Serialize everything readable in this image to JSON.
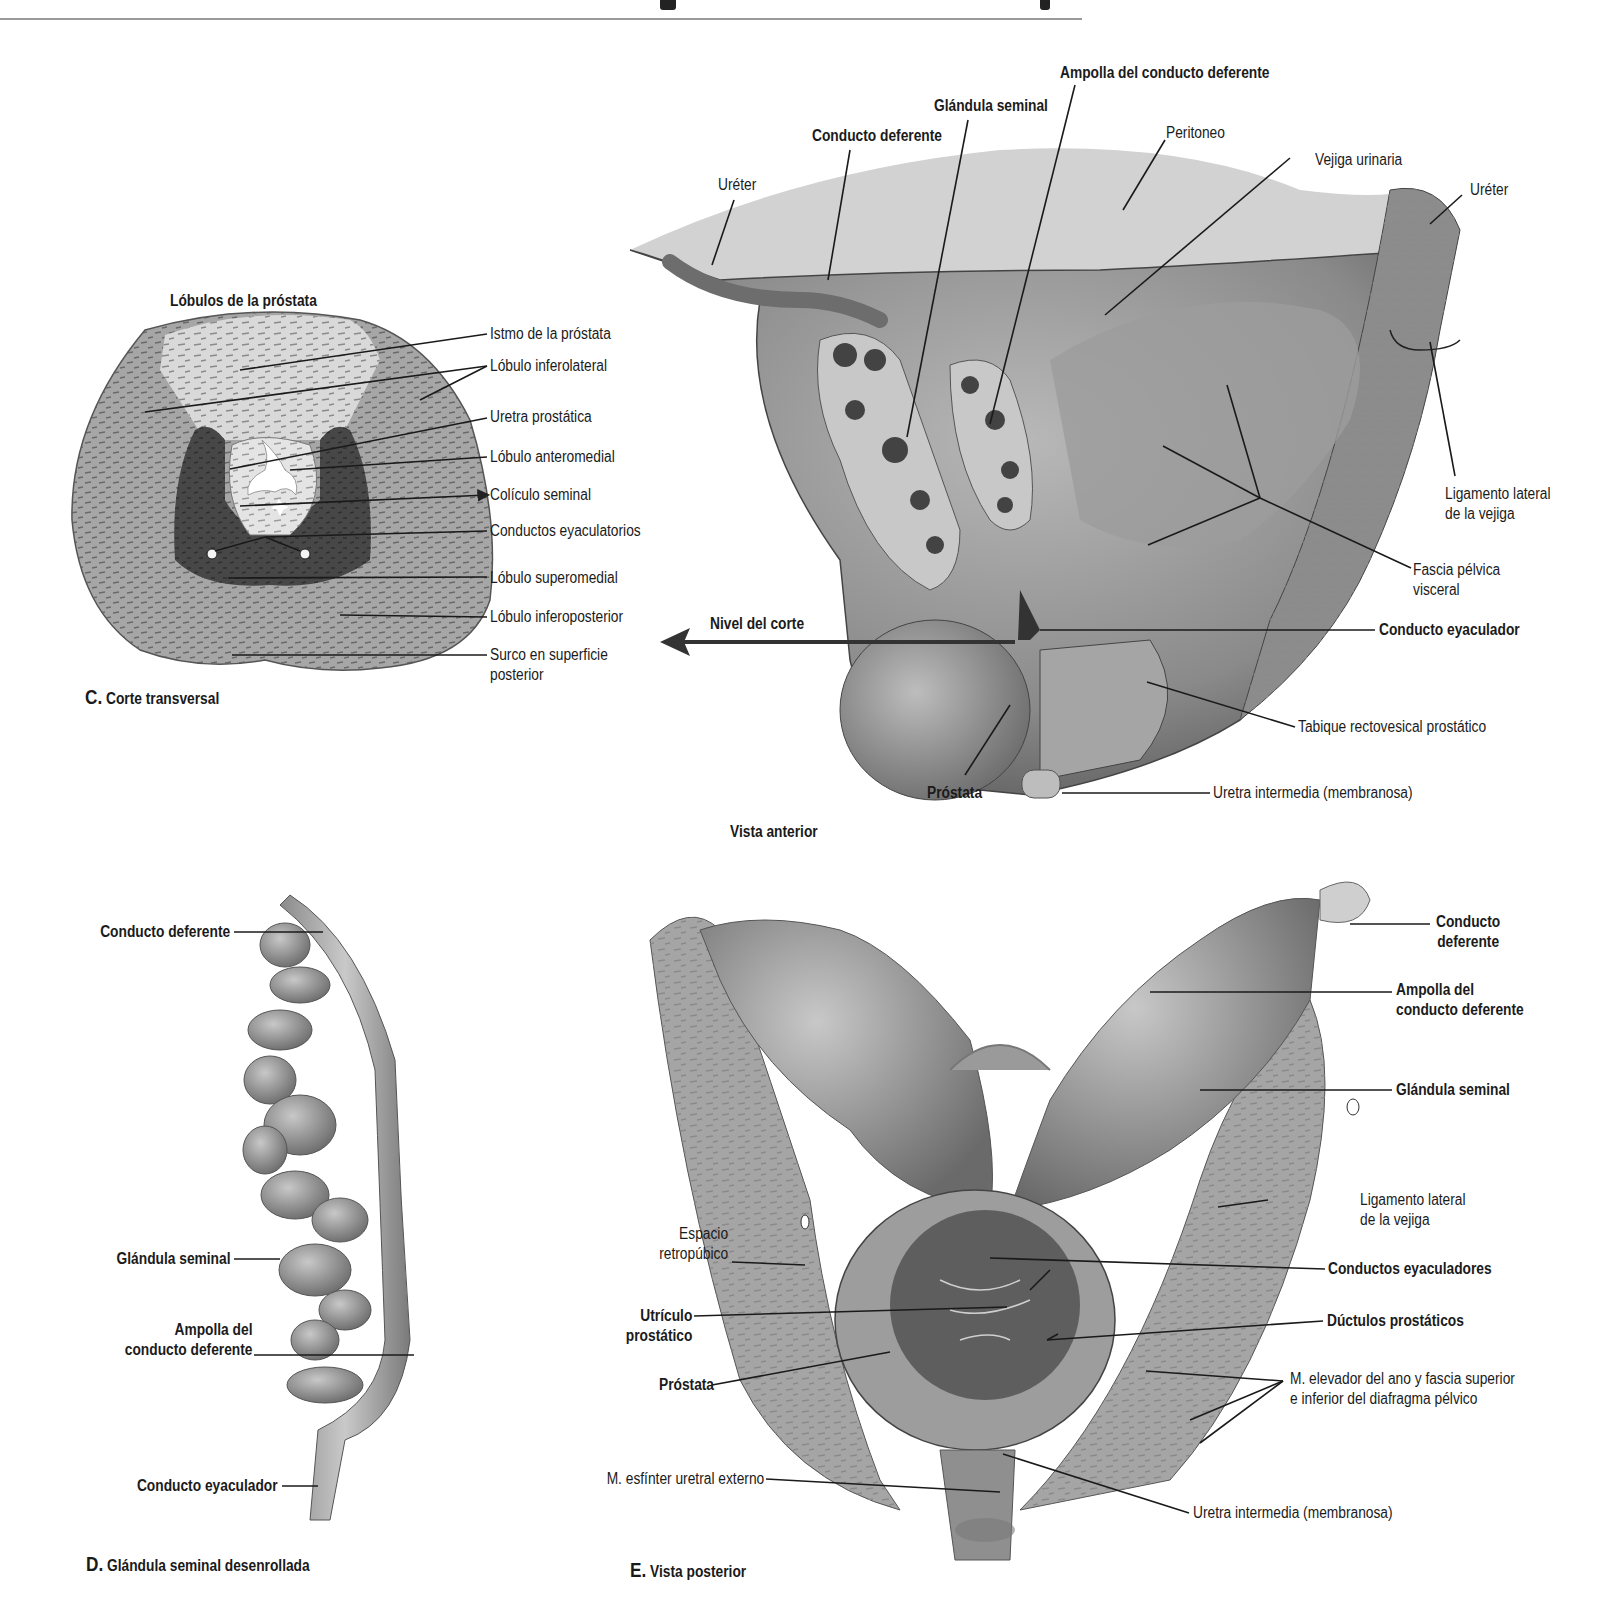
{
  "page": {
    "background": "#ffffff",
    "rule_color": "#9a9a9a"
  },
  "figure_c": {
    "title": "Lóbulos de la próstata",
    "caption_letter": "C.",
    "caption_text": "Corte transversal",
    "labels": [
      {
        "text": "Istmo de la próstata"
      },
      {
        "text": "Lóbulo inferolateral"
      },
      {
        "text": "Uretra prostática"
      },
      {
        "text": "Lóbulo anteromedial"
      },
      {
        "text": "Colículo seminal"
      },
      {
        "text": "Conductos eyaculatorios"
      },
      {
        "text": "Lóbulo superomedial"
      },
      {
        "text": "Lóbulo inferoposterior"
      },
      {
        "text": "Surco en superficie\nposterior"
      }
    ],
    "colors": {
      "outer": "#a8a8a8",
      "isthmus": "#d6d6d6",
      "medial": "#4a4a4a",
      "urethra_zone": "#e2e2e2"
    }
  },
  "figure_anterior": {
    "caption": "Vista anterior",
    "cut_level_label": "Nivel del corte",
    "labels_bold": [
      {
        "text": "Ampolla del conducto deferente"
      },
      {
        "text": "Glándula seminal"
      },
      {
        "text": "Conducto deferente"
      },
      {
        "text": "Conducto eyaculador"
      },
      {
        "text": "Próstata"
      }
    ],
    "labels_regular": [
      {
        "text": "Peritoneo"
      },
      {
        "text": "Vejiga urinaria"
      },
      {
        "text": "Uréter"
      },
      {
        "text": "Uréter"
      },
      {
        "text": "Ligamento lateral\nde la vejiga"
      },
      {
        "text": "Fascia pélvica\nvisceral"
      },
      {
        "text": "Tabique rectovesical prostático"
      },
      {
        "text": "Uretra intermedia (membranosa)"
      }
    ]
  },
  "figure_d": {
    "caption_letter": "D.",
    "caption_text": "Glándula seminal desenrollada",
    "labels": [
      {
        "text": "Conducto deferente"
      },
      {
        "text": "Glándula seminal"
      },
      {
        "text": "Ampolla del\nconducto deferente"
      },
      {
        "text": "Conducto eyaculador"
      }
    ]
  },
  "figure_e": {
    "caption_letter": "E.",
    "caption_text": "Vista posterior",
    "labels_bold": [
      {
        "text": "Conducto\ndeferente"
      },
      {
        "text": "Ampolla del\nconducto deferente"
      },
      {
        "text": "Glándula seminal"
      },
      {
        "text": "Conductos eyaculadores"
      },
      {
        "text": "Dúctulos prostáticos"
      },
      {
        "text": "Utrículo\nprostático"
      },
      {
        "text": "Próstata"
      }
    ],
    "labels_regular": [
      {
        "text": "Ligamento lateral\nde la vejiga"
      },
      {
        "text": "Espacio\nretropúbico"
      },
      {
        "text": "M. elevador del ano y fascia superior\ne inferior del diafragma pélvico"
      },
      {
        "text": "M. esfínter uretral externo"
      },
      {
        "text": "Uretra intermedia (membranosa)"
      }
    ]
  }
}
